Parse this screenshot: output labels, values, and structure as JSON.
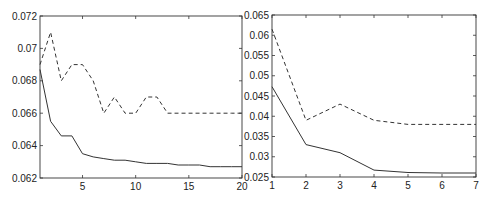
{
  "chart_data": [
    {
      "type": "line",
      "title": "",
      "xlabel": "",
      "ylabel": "",
      "xlim": [
        1,
        20
      ],
      "ylim": [
        0.062,
        0.072
      ],
      "grid": false,
      "legend": null,
      "x_ticks": [
        5,
        10,
        15,
        20
      ],
      "y_ticks": [
        0.062,
        0.064,
        0.066,
        0.068,
        0.07,
        0.072
      ],
      "x_tick_labels": [
        "5",
        "10",
        "15",
        "20"
      ],
      "y_tick_labels": [
        "0.062",
        "0.064",
        "0.066",
        "0.068",
        "0.07",
        "0.072"
      ],
      "x": [
        1,
        2,
        3,
        4,
        5,
        6,
        7,
        8,
        9,
        10,
        11,
        12,
        13,
        14,
        15,
        16,
        17,
        18,
        19,
        20
      ],
      "series": [
        {
          "name": "dashed",
          "style": "dashed",
          "values": [
            0.069,
            0.071,
            0.068,
            0.069,
            0.069,
            0.068,
            0.066,
            0.067,
            0.066,
            0.066,
            0.067,
            0.067,
            0.066,
            0.066,
            0.066,
            0.066,
            0.066,
            0.066,
            0.066,
            0.066
          ]
        },
        {
          "name": "solid",
          "style": "solid",
          "values": [
            0.0687,
            0.0655,
            0.0646,
            0.0646,
            0.0635,
            0.0633,
            0.0632,
            0.0631,
            0.0631,
            0.063,
            0.0629,
            0.0629,
            0.0629,
            0.0628,
            0.0628,
            0.0628,
            0.0627,
            0.0627,
            0.0627,
            0.0627
          ]
        }
      ]
    },
    {
      "type": "line",
      "title": "",
      "xlabel": "",
      "ylabel": "",
      "xlim": [
        1,
        7
      ],
      "ylim": [
        0.025,
        0.065
      ],
      "grid": false,
      "legend": null,
      "x_ticks": [
        1,
        2,
        3,
        4,
        5,
        6,
        7
      ],
      "y_ticks": [
        0.025,
        0.03,
        0.035,
        0.04,
        0.045,
        0.05,
        0.055,
        0.06,
        0.065
      ],
      "x_tick_labels": [
        "1",
        "2",
        "3",
        "4",
        "5",
        "6",
        "7"
      ],
      "y_tick_labels": [
        "0.025",
        "0.03",
        "0.035",
        "0.04",
        "0.045",
        "0.05",
        "0.055",
        "0.06",
        "0.065"
      ],
      "x": [
        1,
        2,
        3,
        4,
        5,
        6,
        7
      ],
      "series": [
        {
          "name": "dashed",
          "style": "dashed",
          "values": [
            0.0615,
            0.039,
            0.043,
            0.039,
            0.038,
            0.038,
            0.038
          ]
        },
        {
          "name": "solid",
          "style": "solid",
          "values": [
            0.0473,
            0.033,
            0.031,
            0.0267,
            0.0261,
            0.026,
            0.026
          ]
        }
      ]
    }
  ]
}
